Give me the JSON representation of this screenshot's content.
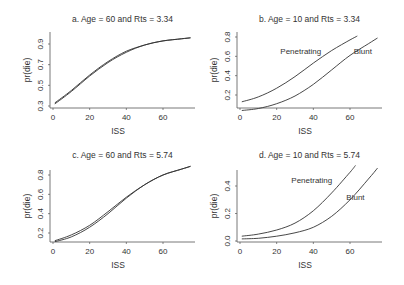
{
  "chart_data": [
    {
      "type": "line",
      "panel": "a",
      "title": "a. Age = 60 and Rts = 3.34",
      "xlabel": "ISS",
      "ylabel": "pr(die)",
      "xticks": [
        0,
        20,
        40,
        60
      ],
      "yticks": [
        0.3,
        0.5,
        0.7,
        0.9
      ],
      "xlim": [
        0,
        75
      ],
      "ylim": [
        0.3,
        0.97
      ],
      "series": [
        {
          "name": "Penetrating",
          "x": [
            1,
            10,
            20,
            30,
            40,
            50,
            60,
            70,
            75
          ],
          "values": [
            0.33,
            0.45,
            0.6,
            0.73,
            0.83,
            0.89,
            0.93,
            0.95,
            0.96
          ]
        },
        {
          "name": "Blunt",
          "x": [
            1,
            10,
            20,
            30,
            40,
            50,
            60,
            70,
            75
          ],
          "values": [
            0.32,
            0.44,
            0.59,
            0.72,
            0.82,
            0.89,
            0.93,
            0.95,
            0.96
          ]
        }
      ],
      "annotations": []
    },
    {
      "type": "line",
      "panel": "b",
      "title": "b. Age = 10 and Rts = 3.34",
      "xlabel": "ISS",
      "ylabel": "pr(die)",
      "xticks": [
        0,
        20,
        40,
        60
      ],
      "yticks": [
        0.2,
        0.4,
        0.6,
        0.8
      ],
      "xlim": [
        0,
        75
      ],
      "ylim": [
        0.0,
        0.82
      ],
      "series": [
        {
          "name": "Penetrating",
          "x": [
            1,
            10,
            20,
            30,
            40,
            50,
            60,
            64
          ],
          "values": [
            0.13,
            0.18,
            0.27,
            0.39,
            0.53,
            0.66,
            0.77,
            0.81
          ]
        },
        {
          "name": "Blunt",
          "x": [
            1,
            10,
            20,
            30,
            40,
            50,
            60,
            70,
            75
          ],
          "values": [
            0.04,
            0.06,
            0.11,
            0.19,
            0.31,
            0.46,
            0.61,
            0.73,
            0.79
          ]
        }
      ],
      "annotations": [
        {
          "text": "Penetrating",
          "x": 22,
          "y": 0.62
        },
        {
          "text": "Blunt",
          "x": 62,
          "y": 0.62
        }
      ]
    },
    {
      "type": "line",
      "panel": "c",
      "title": "c. Age = 60 and Rts = 5.74",
      "xlabel": "ISS",
      "ylabel": "pr(die)",
      "xticks": [
        0,
        20,
        40,
        60
      ],
      "yticks": [
        0.2,
        0.4,
        0.6,
        0.8
      ],
      "xlim": [
        0,
        75
      ],
      "ylim": [
        0.07,
        0.92
      ],
      "series": [
        {
          "name": "Penetrating",
          "x": [
            1,
            10,
            20,
            30,
            40,
            50,
            60,
            70,
            75
          ],
          "values": [
            0.12,
            0.18,
            0.28,
            0.42,
            0.57,
            0.7,
            0.8,
            0.86,
            0.89
          ]
        },
        {
          "name": "Blunt",
          "x": [
            1,
            10,
            20,
            30,
            40,
            50,
            60,
            70,
            75
          ],
          "values": [
            0.11,
            0.16,
            0.26,
            0.4,
            0.56,
            0.7,
            0.8,
            0.86,
            0.89
          ]
        }
      ],
      "annotations": []
    },
    {
      "type": "line",
      "panel": "d",
      "title": "d. Age = 10 and Rts = 5.74",
      "xlabel": "ISS",
      "ylabel": "pr(die)",
      "xticks": [
        0,
        20,
        40,
        60
      ],
      "yticks": [
        0.0,
        0.2,
        0.4
      ],
      "xlim": [
        0,
        75
      ],
      "ylim": [
        0.0,
        0.56
      ],
      "series": [
        {
          "name": "Penetrating",
          "x": [
            1,
            10,
            20,
            30,
            40,
            50,
            60,
            63
          ],
          "values": [
            0.035,
            0.05,
            0.08,
            0.13,
            0.22,
            0.35,
            0.5,
            0.55
          ]
        },
        {
          "name": "Blunt",
          "x": [
            1,
            10,
            20,
            30,
            40,
            50,
            60,
            70,
            75
          ],
          "values": [
            0.015,
            0.02,
            0.035,
            0.06,
            0.1,
            0.18,
            0.3,
            0.45,
            0.53
          ]
        }
      ],
      "annotations": [
        {
          "text": "Penetrating",
          "x": 28,
          "y": 0.42
        },
        {
          "text": "Blunt",
          "x": 58,
          "y": 0.3
        }
      ]
    }
  ]
}
